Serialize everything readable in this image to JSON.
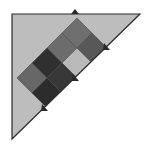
{
  "canvas": {
    "width": 147,
    "height": 150,
    "background": "#ffffff"
  },
  "triangle": {
    "points": [
      [
        12,
        14
      ],
      [
        140,
        14
      ],
      [
        12,
        139
      ]
    ],
    "fill": "#bdbdbd",
    "stroke": "#2b2b2b",
    "stroke_width": 1.2
  },
  "lattice": {
    "half_diagonal": 15,
    "stroke": "#4a4a4a",
    "cells": [
      {
        "id": "A",
        "cx": 77,
        "cy": 33,
        "fill": "#6f6f6f"
      },
      {
        "id": "B",
        "cx": 92,
        "cy": 48,
        "fill": "#585858"
      },
      {
        "id": "C",
        "cx": 62,
        "cy": 48,
        "fill": "#6c6c6c"
      },
      {
        "id": "D",
        "cx": 77,
        "cy": 63,
        "fill": "#b9b9b9"
      },
      {
        "id": "E",
        "cx": 47,
        "cy": 63,
        "fill": "#303030"
      },
      {
        "id": "F",
        "cx": 62,
        "cy": 78,
        "fill": "#383838"
      },
      {
        "id": "G",
        "cx": 32,
        "cy": 78,
        "fill": "#676767"
      },
      {
        "id": "H",
        "cx": 47,
        "cy": 93,
        "fill": "#2c2c2c"
      }
    ]
  },
  "markers": [
    {
      "name": "top-edge-arrow",
      "x": 75,
      "y": 14,
      "dir": "up"
    },
    {
      "name": "hypotenuse-arrow-1",
      "x": 107,
      "y": 47,
      "dir": "down-right"
    },
    {
      "name": "hypotenuse-arrow-2",
      "x": 76,
      "y": 78,
      "dir": "down-right"
    },
    {
      "name": "hypotenuse-arrow-3",
      "x": 45,
      "y": 108,
      "dir": "down-right"
    }
  ]
}
